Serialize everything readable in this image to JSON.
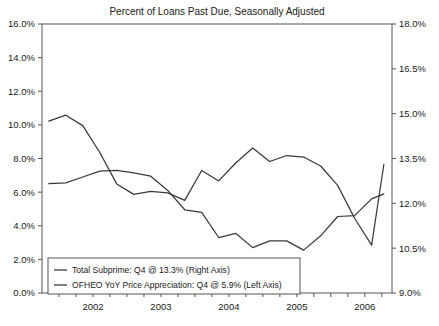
{
  "chart_data": {
    "type": "line",
    "title": "Percent of Loans Past Due, Seasonally Adjusted",
    "xlabel": "",
    "ylabel": "",
    "grid": false,
    "legend_position": "bottom-left",
    "x_tick_labels": [
      "2002",
      "2003",
      "2004",
      "2005",
      "2006"
    ],
    "x_tick_values": [
      2002,
      2003,
      2004,
      2005,
      2006
    ],
    "x_minor_ticks_per_year": 4,
    "xlim": [
      2001.75,
      2006.9
    ],
    "left_axis": {
      "label": "OFHEO YoY Price Appreciation (Left Axis)",
      "ylim": [
        0.0,
        16.0
      ],
      "tick_labels": [
        "0.0%",
        "2.0%",
        "4.0%",
        "6.0%",
        "8.0%",
        "10.0%",
        "12.0%",
        "14.0%",
        "16.0%"
      ],
      "tick_values": [
        0.0,
        2.0,
        4.0,
        6.0,
        8.0,
        10.0,
        12.0,
        14.0,
        16.0
      ]
    },
    "right_axis": {
      "label": "Total Subprime (Right Axis)",
      "ylim": [
        9.0,
        18.0
      ],
      "tick_labels": [
        "9.0%",
        "10.5%",
        "12.0%",
        "13.5%",
        "15.0%",
        "16.5%",
        "18.0%"
      ],
      "tick_values": [
        9.0,
        10.5,
        12.0,
        13.5,
        15.0,
        16.5,
        18.0
      ]
    },
    "series": [
      {
        "name": "Total Subprime: Q4 @ 13.3% (Right Axis)",
        "axis": "right",
        "color": "#3a3a3a",
        "x": [
          2001.85,
          2002.1,
          2002.35,
          2002.6,
          2002.85,
          2003.1,
          2003.35,
          2003.6,
          2003.85,
          2004.1,
          2004.35,
          2004.6,
          2004.85,
          2005.1,
          2005.35,
          2005.6,
          2005.85,
          2006.1,
          2006.35,
          2006.6,
          2006.78
        ],
        "values": [
          14.75,
          14.95,
          14.6,
          13.7,
          12.65,
          12.3,
          12.4,
          12.35,
          12.1,
          13.1,
          12.75,
          13.35,
          13.85,
          13.4,
          13.6,
          13.55,
          13.25,
          12.6,
          11.5,
          10.6,
          13.3
        ],
        "last_point_label": "Q4 @ 13.3%"
      },
      {
        "name": "OFHEO YoY Price Appreciation: Q4 @ 5.9% (Left Axis)",
        "axis": "left",
        "color": "#3a3a3a",
        "x": [
          2001.85,
          2002.1,
          2002.35,
          2002.6,
          2002.85,
          2003.1,
          2003.35,
          2003.6,
          2003.85,
          2004.1,
          2004.35,
          2004.6,
          2004.85,
          2005.1,
          2005.35,
          2005.6,
          2005.85,
          2006.1,
          2006.35,
          2006.6,
          2006.78
        ],
        "values": [
          6.5,
          6.55,
          6.9,
          7.25,
          7.3,
          7.15,
          6.95,
          6.1,
          4.95,
          4.8,
          3.3,
          3.55,
          2.7,
          3.1,
          3.1,
          2.55,
          3.4,
          4.55,
          4.6,
          5.6,
          5.9
        ],
        "last_point_label": "Q4 @ 5.9%"
      }
    ],
    "legend": [
      {
        "label": "Total Subprime: Q4 @ 13.3% (Right Axis)",
        "marker": "line",
        "color": "#3a3a3a"
      },
      {
        "label": "OFHEO YoY Price Appreciation: Q4 @ 5.9% (Left Axis)",
        "marker": "line",
        "color": "#3a3a3a"
      }
    ]
  }
}
